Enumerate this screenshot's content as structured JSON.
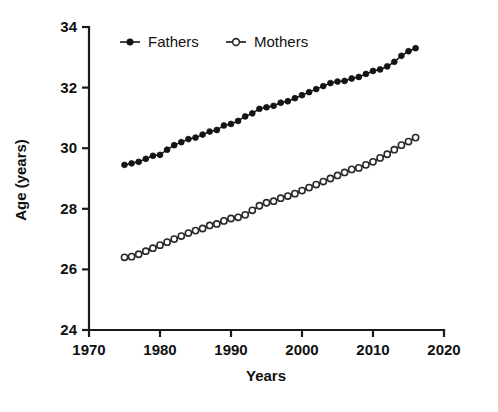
{
  "chart_data": {
    "type": "line",
    "title": "",
    "xlabel": "Years",
    "ylabel": "Age (years)",
    "xlim": [
      1970,
      2020
    ],
    "ylim": [
      24,
      34
    ],
    "xticks": [
      1970,
      1980,
      1990,
      2000,
      2010,
      2020
    ],
    "yticks": [
      24,
      26,
      28,
      30,
      32,
      34
    ],
    "grid": false,
    "legend_position": "top-center",
    "x": [
      1975,
      1976,
      1977,
      1978,
      1979,
      1980,
      1981,
      1982,
      1983,
      1984,
      1985,
      1986,
      1987,
      1988,
      1989,
      1990,
      1991,
      1992,
      1993,
      1994,
      1995,
      1996,
      1997,
      1998,
      1999,
      2000,
      2001,
      2002,
      2003,
      2004,
      2005,
      2006,
      2007,
      2008,
      2009,
      2010,
      2011,
      2012,
      2013,
      2014,
      2015,
      2016
    ],
    "series": [
      {
        "name": "Fathers",
        "marker": "filled-circle",
        "color": "#141414",
        "values": [
          29.45,
          29.5,
          29.55,
          29.65,
          29.75,
          29.78,
          29.95,
          30.1,
          30.2,
          30.3,
          30.35,
          30.45,
          30.55,
          30.6,
          30.75,
          30.8,
          30.9,
          31.05,
          31.15,
          31.3,
          31.35,
          31.4,
          31.5,
          31.55,
          31.65,
          31.75,
          31.85,
          31.95,
          32.05,
          32.15,
          32.2,
          32.22,
          32.3,
          32.35,
          32.45,
          32.55,
          32.6,
          32.7,
          32.85,
          33.05,
          33.2,
          33.3
        ]
      },
      {
        "name": "Mothers",
        "marker": "open-circle",
        "color": "#2a2a2a",
        "values": [
          26.4,
          26.42,
          26.5,
          26.6,
          26.7,
          26.8,
          26.9,
          27.0,
          27.1,
          27.2,
          27.28,
          27.35,
          27.45,
          27.5,
          27.6,
          27.68,
          27.72,
          27.8,
          27.95,
          28.1,
          28.2,
          28.25,
          28.35,
          28.42,
          28.5,
          28.6,
          28.7,
          28.8,
          28.9,
          29.0,
          29.1,
          29.2,
          29.3,
          29.35,
          29.45,
          29.55,
          29.68,
          29.8,
          29.95,
          30.1,
          30.22,
          30.35
        ]
      }
    ]
  },
  "legend": {
    "entries": [
      {
        "label": "Fathers"
      },
      {
        "label": "Mothers"
      }
    ]
  },
  "axes": {
    "x_title": "Years",
    "y_title": "Age (years)"
  }
}
